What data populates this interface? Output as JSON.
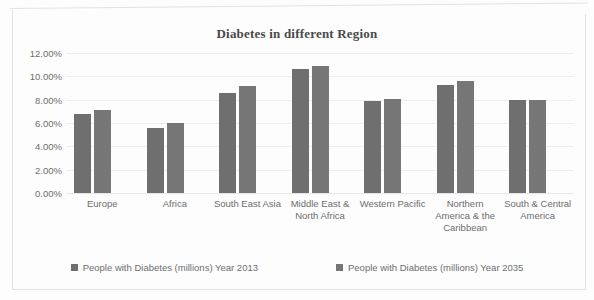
{
  "chart_data": {
    "type": "bar",
    "title": "Diabetes in different Region",
    "xlabel": "",
    "ylabel": "",
    "ylim": [
      0,
      0.12
    ],
    "grid": true,
    "legend_position": "bottom",
    "y_ticks": [
      "0.00%",
      "2.00%",
      "4.00%",
      "6.00%",
      "8.00%",
      "10.00%",
      "12.00%"
    ],
    "y_tick_values": [
      0,
      2,
      4,
      6,
      8,
      10,
      12
    ],
    "categories": [
      "Europe",
      "Africa",
      "South East Asia",
      "Middle East & North Africa",
      "Western Pacific",
      "Northern America & the Caribbean",
      "South & Central America"
    ],
    "series": [
      {
        "name": "People with Diabetes (millions) Year 2013",
        "color": "#6f6f6f",
        "values": [
          6.8,
          5.6,
          8.6,
          10.6,
          7.9,
          9.3,
          8.0
        ]
      },
      {
        "name": "People with Diabetes (millions) Year 2035",
        "color": "#767676",
        "values": [
          7.1,
          6.0,
          9.2,
          10.9,
          8.1,
          9.6,
          8.0
        ]
      }
    ]
  }
}
